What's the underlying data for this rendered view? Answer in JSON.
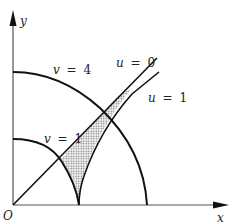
{
  "figure": {
    "axes": {
      "x_label": "x",
      "y_label": "y",
      "origin_label": "O"
    },
    "curves": [
      {
        "name": "v = 4",
        "var": "v",
        "eq": "=",
        "val": "4",
        "type": "outer-arc"
      },
      {
        "name": "v = 1",
        "var": "v",
        "eq": "=",
        "val": "1",
        "type": "inner-arc"
      },
      {
        "name": "u = 0",
        "var": "u",
        "eq": "=",
        "val": "0",
        "type": "line"
      },
      {
        "name": "u = 1",
        "var": "u",
        "eq": "=",
        "val": "1",
        "type": "line"
      }
    ],
    "shaded_region": "region bounded by u = 0, u = 1, v = 1, v = 4",
    "colors": {
      "stroke": "#111111",
      "axis": "#333333",
      "shade": "#bdbdbd",
      "background": "#ffffff"
    }
  }
}
